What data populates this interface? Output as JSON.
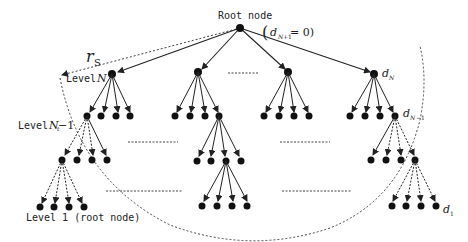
{
  "diagram": {
    "type": "tree",
    "labels": {
      "root": "Root node",
      "root_eq_open": "(",
      "root_eq_d": "d",
      "root_eq_sub": "N",
      "root_eq_subsub": "t",
      "root_eq_sub2": "+1",
      "root_eq_rest": " = 0)",
      "radius": "r",
      "radius_sub": "S",
      "level_nt": "Level",
      "level_nt_math": "N",
      "level_nt_sub": "t",
      "level_nt1": "Level",
      "level_nt1_math": "N",
      "level_nt1_sub": "t",
      "level_nt1_rest": " −1",
      "level_1": "Level 1 (root node)",
      "d_nt": "d",
      "d_nt_sub": "N",
      "d_nt_subsub": "t",
      "d_nt1": "d",
      "d_nt1_sub": "N",
      "d_nt1_subsub": "t",
      "d_nt1_rest": "−1",
      "d_1": "d",
      "d_1_sub": "1"
    },
    "colors": {
      "node": "#111111",
      "edge": "#222222",
      "dashed": "#444444"
    }
  }
}
